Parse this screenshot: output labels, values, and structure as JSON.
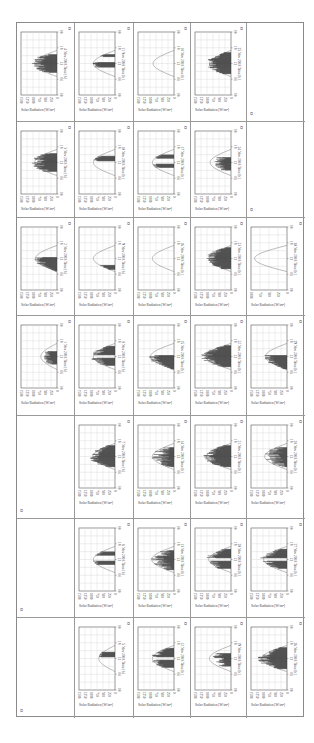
{
  "document": {
    "orientation": "rotated-90-clockwise",
    "cell_end_marker": "¤",
    "table": {
      "columns": 5,
      "rows": 7,
      "axis_labels": {
        "value_axis_title": "Solar Radiation [W/m²]",
        "time_axis_suffix": "Time [h]",
        "time_ticks": [
          "00",
          "06",
          "12",
          "18",
          "00"
        ]
      },
      "cells": [
        {
          "row": 0,
          "col": 0,
          "date": "4 Nov 2018",
          "ticks": [
            "1500",
            "1250",
            "1000",
            "750",
            "500",
            "250",
            "0"
          ],
          "max": 1500,
          "pattern": "dense-mid",
          "peak": 0.62
        },
        {
          "row": 0,
          "col": 1,
          "date": "11 Nov 2018",
          "ticks": [
            "1500",
            "1250",
            "1000",
            "750",
            "500",
            "250",
            "0"
          ],
          "max": 1500,
          "pattern": "sparse-clear",
          "peak": 0.6
        },
        {
          "row": 0,
          "col": 2,
          "date": "18 Nov 2018",
          "ticks": [
            "1500",
            "1250",
            "1000",
            "750",
            "500",
            "250",
            "0"
          ],
          "max": 1500,
          "pattern": "clear",
          "peak": 0.58
        },
        {
          "row": 0,
          "col": 3,
          "date": "25 Nov 2018",
          "ticks": [
            "1500",
            "1250",
            "1000",
            "750",
            "500",
            "250",
            "0"
          ],
          "max": 1500,
          "pattern": "dense",
          "peak": 0.6
        },
        {
          "row": 0,
          "col": 4,
          "date": "",
          "empty": true
        },
        {
          "row": 1,
          "col": 0,
          "date": "3 Nov 2018",
          "ticks": [
            "1500",
            "1250",
            "1000",
            "750",
            "500",
            "250",
            "0"
          ],
          "max": 1500,
          "pattern": "dense-mid",
          "peak": 0.62
        },
        {
          "row": 1,
          "col": 1,
          "date": "10 Nov 2018",
          "ticks": [
            "1500",
            "1250",
            "1000",
            "750",
            "500",
            "250",
            "0"
          ],
          "max": 1500,
          "pattern": "clear-late",
          "peak": 0.6
        },
        {
          "row": 1,
          "col": 2,
          "date": "17 Nov 2018",
          "ticks": [
            "1500",
            "1250",
            "1000",
            "750",
            "500",
            "250",
            "0"
          ],
          "max": 1500,
          "pattern": "clear-two",
          "peak": 0.6
        },
        {
          "row": 1,
          "col": 3,
          "date": "24 Nov 2018",
          "ticks": [
            "1500",
            "1250",
            "1000",
            "750",
            "500",
            "250",
            "0"
          ],
          "max": 1500,
          "pattern": "sparse-mid",
          "peak": 0.58
        },
        {
          "row": 1,
          "col": 4,
          "date": "",
          "empty": true
        },
        {
          "row": 2,
          "col": 0,
          "date": "2 Nov 2018",
          "ticks": [
            "1500",
            "1250",
            "1000",
            "750",
            "500",
            "250",
            "0"
          ],
          "max": 1500,
          "pattern": "morning-dense",
          "peak": 0.6
        },
        {
          "row": 2,
          "col": 1,
          "date": "9 Nov 2018",
          "ticks": [
            "1500",
            "1250",
            "1000",
            "750",
            "500",
            "250",
            "0"
          ],
          "max": 1500,
          "pattern": "clear-morning-dip",
          "peak": 0.6
        },
        {
          "row": 2,
          "col": 2,
          "date": "16 Nov 2018",
          "ticks": [
            "1500",
            "1250",
            "1000",
            "750",
            "500",
            "250",
            "0"
          ],
          "max": 1500,
          "pattern": "clear",
          "peak": 0.6
        },
        {
          "row": 2,
          "col": 3,
          "date": "23 Nov 2018",
          "ticks": [
            "1500",
            "1250",
            "1000",
            "750",
            "500",
            "250",
            "0"
          ],
          "max": 1500,
          "pattern": "dense",
          "peak": 0.6
        },
        {
          "row": 2,
          "col": 4,
          "date": "30 Nov 2018",
          "ticks": [
            "1000",
            "750",
            "500",
            "250",
            "0"
          ],
          "max": 1000,
          "pattern": "clear",
          "peak": 0.9
        },
        {
          "row": 3,
          "col": 0,
          "date": "1 Nov 2018",
          "ticks": [
            "1500",
            "1250",
            "1000",
            "750",
            "500",
            "250",
            "0"
          ],
          "max": 1500,
          "pattern": "sparse-mid",
          "peak": 0.45
        },
        {
          "row": 3,
          "col": 1,
          "date": "8 Nov 2018",
          "ticks": [
            "1500",
            "1250",
            "1000",
            "750",
            "500",
            "250",
            "0"
          ],
          "max": 1500,
          "pattern": "dense-two",
          "peak": 0.6
        },
        {
          "row": 3,
          "col": 2,
          "date": "15 Nov 2018",
          "ticks": [
            "1500",
            "1250",
            "1000",
            "750",
            "500",
            "250",
            "0"
          ],
          "max": 1500,
          "pattern": "morning-dense",
          "peak": 0.65
        },
        {
          "row": 3,
          "col": 3,
          "date": "22 Nov 2018",
          "ticks": [
            "1500",
            "1250",
            "1000",
            "750",
            "500",
            "250",
            "0"
          ],
          "max": 1500,
          "pattern": "dense",
          "peak": 0.7
        },
        {
          "row": 3,
          "col": 4,
          "date": "29 Nov 2018",
          "ticks": [
            "1500",
            "1250",
            "1000",
            "750",
            "500",
            "250",
            "0"
          ],
          "max": 1500,
          "pattern": "morning-dense",
          "peak": 0.6
        },
        {
          "row": 4,
          "col": 0,
          "date": "",
          "empty": true
        },
        {
          "row": 4,
          "col": 1,
          "date": "7 Nov 2018",
          "ticks": [
            "1500",
            "1250",
            "1000",
            "750",
            "500",
            "250",
            "0"
          ],
          "max": 1500,
          "pattern": "dense",
          "peak": 0.62
        },
        {
          "row": 4,
          "col": 2,
          "date": "14 Nov 2018",
          "ticks": [
            "1500",
            "1250",
            "1000",
            "750",
            "500",
            "250",
            "0"
          ],
          "max": 1500,
          "pattern": "sparse-spiky",
          "peak": 0.6
        },
        {
          "row": 4,
          "col": 3,
          "date": "21 Nov 2018",
          "ticks": [
            "1500",
            "1250",
            "1000",
            "750",
            "500",
            "250",
            "0"
          ],
          "max": 1500,
          "pattern": "dense",
          "peak": 0.68
        },
        {
          "row": 4,
          "col": 4,
          "date": "28 Nov 2018",
          "ticks": [
            "1500",
            "1250",
            "1000",
            "750",
            "500",
            "250",
            "0"
          ],
          "max": 1500,
          "pattern": "sparse-spiky",
          "peak": 0.62
        },
        {
          "row": 5,
          "col": 0,
          "date": "",
          "empty": true
        },
        {
          "row": 5,
          "col": 1,
          "date": "6 Nov 2018",
          "ticks": [
            "1500",
            "1250",
            "1000",
            "750",
            "500",
            "250",
            "0"
          ],
          "max": 1500,
          "pattern": "clear-two",
          "peak": 0.6
        },
        {
          "row": 5,
          "col": 2,
          "date": "13 Nov 2018",
          "ticks": [
            "1500",
            "1250",
            "1000",
            "750",
            "500",
            "250",
            "0"
          ],
          "max": 1500,
          "pattern": "sparse-spiky",
          "peak": 0.62
        },
        {
          "row": 5,
          "col": 3,
          "date": "20 Nov 2018",
          "ticks": [
            "1500",
            "1250",
            "1000",
            "750",
            "500",
            "250",
            "0"
          ],
          "max": 1500,
          "pattern": "dense-two",
          "peak": 0.62
        },
        {
          "row": 5,
          "col": 4,
          "date": "27 Nov 2018",
          "ticks": [
            "1500",
            "1250",
            "1000",
            "750",
            "500",
            "250",
            "0"
          ],
          "max": 1500,
          "pattern": "dense-two",
          "peak": 0.65
        },
        {
          "row": 6,
          "col": 0,
          "date": "",
          "empty": true
        },
        {
          "row": 6,
          "col": 1,
          "date": "5 Nov 2018",
          "ticks": [
            "1500",
            "1250",
            "1000",
            "750",
            "500",
            "250",
            "0"
          ],
          "max": 1500,
          "pattern": "clear-late",
          "peak": 0.45
        },
        {
          "row": 6,
          "col": 2,
          "date": "12 Nov 2018",
          "ticks": [
            "1500",
            "1250",
            "1000",
            "750",
            "500",
            "250",
            "0"
          ],
          "max": 1500,
          "pattern": "dense-two",
          "peak": 0.6
        },
        {
          "row": 6,
          "col": 3,
          "date": "19 Nov 2018",
          "ticks": [
            "1500",
            "1250",
            "1000",
            "750",
            "500",
            "250",
            "0"
          ],
          "max": 1500,
          "pattern": "sparse-mid",
          "peak": 0.6
        },
        {
          "row": 6,
          "col": 4,
          "date": "26 Nov 2018",
          "ticks": [
            "1500",
            "1250",
            "1000",
            "750",
            "500",
            "250",
            "0"
          ],
          "max": 1500,
          "pattern": "dense",
          "peak": 0.7
        }
      ]
    }
  },
  "colors": {
    "border": "#9a9a9a",
    "plot_frame": "#6d6d6d",
    "gridline": "#d4d4d4",
    "envelope": "#8c8c8c",
    "measured": "#3c3c3c",
    "text": "#444444"
  }
}
